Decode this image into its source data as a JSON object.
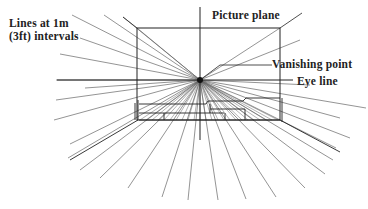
{
  "diagram": {
    "labels": {
      "lines_line1": "Lines at 1m",
      "lines_line2": "(3ft) intervals",
      "picture_plane": "Picture plane",
      "vanishing_point": "Vanishing point",
      "eye_line": "Eye line"
    },
    "vanishing_point": {
      "x": 200,
      "y": 80
    },
    "picture_plane_rect": {
      "x": 137,
      "y": 28,
      "width": 143,
      "height": 92
    },
    "eye_line": {
      "x1": 57,
      "x2": 293,
      "y": 80
    },
    "vertical_axis": {
      "x": 200,
      "y1": 7,
      "y2": 140
    },
    "colors": {
      "line": "#333333",
      "light_line": "#888888",
      "text": "#222222",
      "background": "#ffffff"
    },
    "radial_endpoints": [
      [
        72,
        15
      ],
      [
        104,
        15
      ],
      [
        123,
        17
      ],
      [
        80,
        38
      ],
      [
        60,
        54
      ],
      [
        56,
        80
      ],
      [
        56,
        100
      ],
      [
        85,
        88
      ],
      [
        54,
        120
      ],
      [
        70,
        144
      ],
      [
        68,
        158
      ],
      [
        80,
        170
      ],
      [
        100,
        178
      ],
      [
        128,
        188
      ],
      [
        162,
        197
      ],
      [
        188,
        200
      ],
      [
        218,
        200
      ],
      [
        246,
        199
      ],
      [
        276,
        197
      ],
      [
        305,
        188
      ],
      [
        325,
        174
      ],
      [
        333,
        160
      ],
      [
        336,
        148
      ],
      [
        350,
        138
      ],
      [
        340,
        118
      ],
      [
        366,
        108
      ],
      [
        310,
        85
      ],
      [
        300,
        40
      ],
      [
        280,
        28
      ],
      [
        137,
        28
      ]
    ]
  }
}
